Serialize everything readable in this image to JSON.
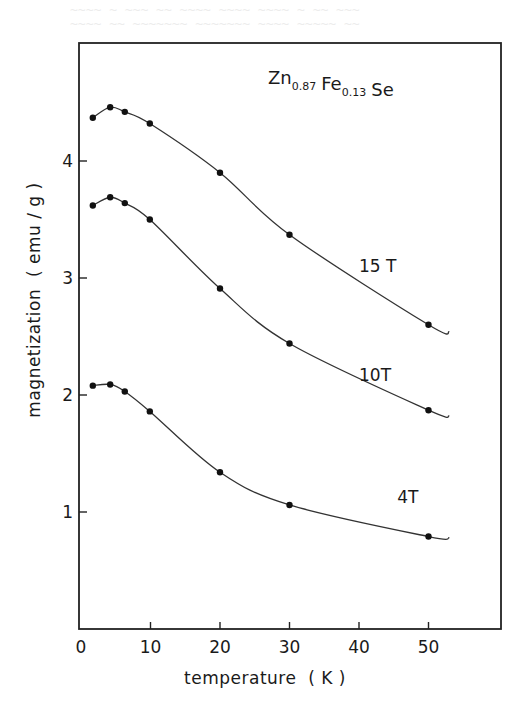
{
  "chart_data": {
    "type": "line",
    "title": {
      "parts": [
        {
          "base": "Zn",
          "sub": "0.87"
        },
        {
          "base": "Fe",
          "sub": "0.13"
        },
        {
          "base": "Se",
          "sub": ""
        }
      ],
      "plain": "Zn0.87 Fe0.13 Se"
    },
    "xlabel": "temperature  ( K )",
    "ylabel": "magnetization  ( emu / g )",
    "xlim": [
      0,
      60
    ],
    "ylim": [
      0,
      4.6
    ],
    "xticks": [
      0,
      10,
      20,
      30,
      40,
      50
    ],
    "xtick_labels": [
      "0",
      "10",
      "20",
      "30",
      "40",
      "50"
    ],
    "yticks": [
      1,
      2,
      3,
      4
    ],
    "ytick_labels": [
      "1",
      "2",
      "3",
      "4"
    ],
    "grid": false,
    "legend": "inline labels next to curves",
    "series": [
      {
        "name": "15 T",
        "points": [
          [
            1.7,
            4.37
          ],
          [
            4.2,
            4.46
          ],
          [
            6.3,
            4.42
          ],
          [
            9.9,
            4.32
          ],
          [
            20,
            3.9
          ],
          [
            30,
            3.37
          ],
          [
            50,
            2.6
          ]
        ],
        "curve_end": [
          53,
          2.54
        ],
        "label_at": [
          40,
          3.05
        ]
      },
      {
        "name": "10T",
        "points": [
          [
            1.7,
            3.62
          ],
          [
            4.2,
            3.69
          ],
          [
            6.3,
            3.64
          ],
          [
            9.9,
            3.5
          ],
          [
            20,
            2.91
          ],
          [
            30,
            2.44
          ],
          [
            50,
            1.87
          ]
        ],
        "curve_end": [
          53,
          1.82
        ],
        "label_at": [
          40,
          2.12
        ]
      },
      {
        "name": "4T",
        "points": [
          [
            1.7,
            2.08
          ],
          [
            4.2,
            2.09
          ],
          [
            6.3,
            2.03
          ],
          [
            9.9,
            1.86
          ],
          [
            20,
            1.34
          ],
          [
            30,
            1.06
          ],
          [
            50,
            0.79
          ]
        ],
        "curve_end": [
          53,
          0.78
        ],
        "label_at": [
          45.5,
          1.08
        ]
      }
    ]
  }
}
